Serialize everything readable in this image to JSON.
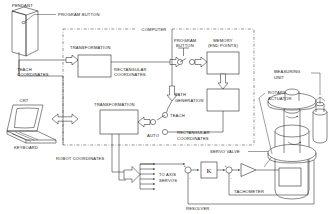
{
  "diagram": {
    "boundary_label": "COMPUTER",
    "labels": {
      "pendant": "PENDANT",
      "program_button_top": "PROGRAM BUTTON",
      "transformation_1": "TRANSFORMATION",
      "transformation_2": "TRANSFORMATION",
      "teach_coordinates": "TEACH\nCOORDINATES",
      "teach_coordinates_l1": "TEACH",
      "teach_coordinates_l2": "COORDINATES",
      "rect_coordinates_1_l1": "RECTANGULAR",
      "rect_coordinates_1_l2": "COORDINATES",
      "rect_coordinates_2_l1": "RECTANGULAR",
      "rect_coordinates_2_l2": "COORDINATES",
      "program_button_mid_l1": "PROGRAM",
      "program_button_mid_l2": "BUTTON",
      "memory_l1": "MEMORY",
      "memory_l2": "(END POINTS)",
      "path_generation_l1": "PATH",
      "path_generation_l2": "GENERATION",
      "teach": "TEACH",
      "auto": "AUTO",
      "crt": "CRT",
      "keyboard": "KEYBOARD",
      "robot_coordinates": "ROBOT COORDINATES",
      "to_axis_servos_l1": "TO AXIS",
      "to_axis_servos_l2": "SERVOS",
      "gain": "K",
      "servo_valve": "SERVO VALVE",
      "tachometer": "TACHOMETER",
      "resolver": "RESOLVER",
      "measuring_unit_l1": "MEASURING",
      "measuring_unit_l2": "UNIT",
      "rotary_actuator_l1": "ROTARY",
      "rotary_actuator_l2": "ACTUATOR",
      "sum1_plus": "+",
      "sum1_minus": "-",
      "sum2_plus": "+",
      "sum2_minus": "-"
    },
    "colors": {
      "line": "#262626",
      "text": "#1a1a1a",
      "background": "#ffffff"
    },
    "blocks": [
      {
        "name": "transformation-1",
        "label": "TRANSFORMATION"
      },
      {
        "name": "memory",
        "label": "MEMORY (END POINTS)"
      },
      {
        "name": "path-generation-block",
        "label": ""
      },
      {
        "name": "transformation-2",
        "label": "TRANSFORMATION"
      },
      {
        "name": "gain-k",
        "label": "K"
      }
    ],
    "axis_servo_arrow_count": 6
  }
}
